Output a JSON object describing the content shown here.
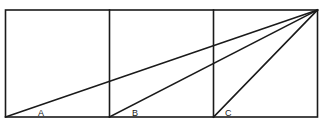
{
  "diagram": {
    "type": "three-squares-angle-diagram",
    "squares": 3,
    "stroke_color": "#1a1a1a",
    "background": "#ffffff",
    "labels": {
      "a": "A",
      "b": "B",
      "c": "C"
    }
  }
}
